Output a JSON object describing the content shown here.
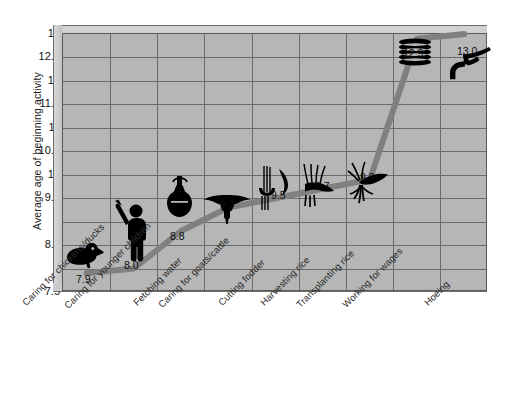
{
  "chart_data": {
    "type": "line",
    "title": "",
    "xlabel": "",
    "ylabel": "Average age of beginning activity",
    "ylim": [
      7.5,
      13
    ],
    "ytick_labels": [
      "13",
      "12.5",
      "12",
      "11.5",
      "11",
      "10.5",
      "10",
      "9.5",
      "9",
      "8.5",
      "8",
      "7.5"
    ],
    "ytick_values": [
      13,
      12.5,
      12,
      11.5,
      11,
      10.5,
      10,
      9.5,
      9,
      8.5,
      8,
      7.5
    ],
    "grid": true,
    "legend": "none",
    "categories": [
      "Caring for chickens/ducks",
      "Caring for younger children",
      "Fetching water",
      "Caring for goats/cattle",
      "Cutting fodder",
      "Harvesting rice",
      "Transplanting rice",
      "Working for wages",
      "Hoeing"
    ],
    "values": [
      7.9,
      8.0,
      8.8,
      9.3,
      9.5,
      9.7,
      9.9,
      12.9,
      13.0
    ],
    "point_labels": [
      "7.9",
      "8.0",
      "8.8",
      "9.3",
      "9.5",
      "9.7",
      "9.9",
      "12.9",
      "13.0"
    ],
    "point_icons": [
      "duck-icon",
      "child-icon",
      "water-pot-icon",
      "goat-icon",
      "sickle-fodder-icon",
      "rice-sheaf-icon",
      "rice-seedling-icon",
      "coin-stack-icon",
      "hoe-icon"
    ],
    "colors": {
      "plot_background": "#b6b6b6",
      "line": "#808080",
      "grid": "#6a6a6a",
      "icon": "#000000",
      "page_background": "#ffffff"
    }
  }
}
